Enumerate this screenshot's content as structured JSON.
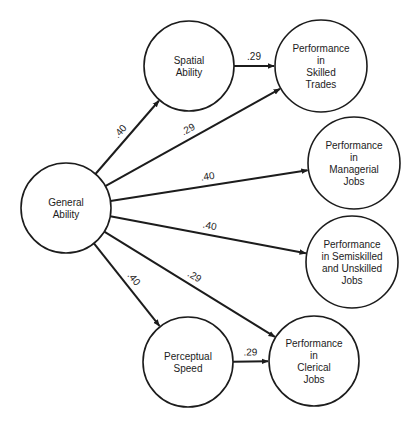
{
  "diagram": {
    "type": "path-diagram",
    "colors": {
      "stroke": "#1c1c1c",
      "background": "#ffffff"
    },
    "nodes": {
      "general": {
        "id": "general",
        "lines": [
          "General",
          "Ability"
        ],
        "cx": 66,
        "cy": 208,
        "r": 45
      },
      "spatial": {
        "id": "spatial",
        "lines": [
          "Spatial",
          "Ability"
        ],
        "cx": 189,
        "cy": 66,
        "r": 45
      },
      "perceptual": {
        "id": "perceptual",
        "lines": [
          "Perceptual",
          "Speed"
        ],
        "cx": 188,
        "cy": 362,
        "r": 45
      },
      "skilled": {
        "id": "skilled",
        "lines": [
          "Performance",
          "in",
          "Skilled",
          "Trades"
        ],
        "cx": 321,
        "cy": 66,
        "r": 46
      },
      "managerial": {
        "id": "managerial",
        "lines": [
          "Performance",
          "in",
          "Managerial",
          "Jobs"
        ],
        "cx": 354,
        "cy": 163,
        "r": 46
      },
      "semiskilled": {
        "id": "semiskilled",
        "lines": [
          "Performance",
          "in Semiskilled",
          "and Unskilled",
          "Jobs"
        ],
        "cx": 352,
        "cy": 262,
        "r": 46
      },
      "clerical": {
        "id": "clerical",
        "lines": [
          "Performance",
          "in",
          "Clerical",
          "Jobs"
        ],
        "cx": 314,
        "cy": 361,
        "r": 45
      }
    },
    "edges": [
      {
        "from": "general",
        "to": "spatial",
        "label": ".40"
      },
      {
        "from": "general",
        "to": "skilled",
        "label": ".29"
      },
      {
        "from": "general",
        "to": "managerial",
        "label": ".40"
      },
      {
        "from": "general",
        "to": "semiskilled",
        "label": ".40"
      },
      {
        "from": "general",
        "to": "clerical",
        "label": ".29"
      },
      {
        "from": "general",
        "to": "perceptual",
        "label": ".40"
      },
      {
        "from": "spatial",
        "to": "skilled",
        "label": ".29"
      },
      {
        "from": "perceptual",
        "to": "clerical",
        "label": ".29"
      }
    ]
  }
}
